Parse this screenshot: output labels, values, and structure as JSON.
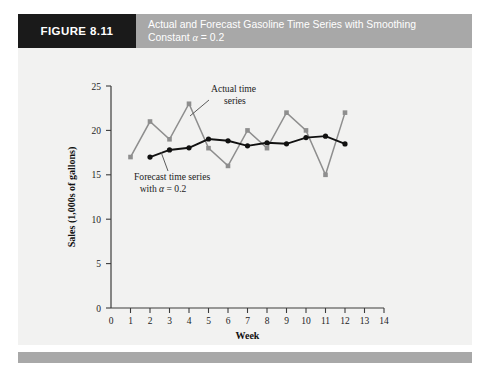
{
  "header": {
    "figure_tag": "FIGURE 8.11",
    "title_line1": "Actual and Forecast Gasoline Time Series with Smoothing",
    "title_line2_pre": "Constant ",
    "title_line2_alpha": "α",
    "title_line2_post": " = 0.2",
    "tag_bg": "#1a1a1a",
    "bar_bg": "#a8a8a8",
    "title_color": "#ffffff"
  },
  "annotations": {
    "actual_label_line1": "Actual time",
    "actual_label_line2": "series",
    "forecast_label_line1": "Forecast time series",
    "forecast_label_line2_pre": "with ",
    "forecast_label_line2_alpha": "α",
    "forecast_label_line2_post": " = 0.2"
  },
  "colors": {
    "actual": "#8e8e8e",
    "forecast": "#111111",
    "panel": "#f2f2f1",
    "axis": "#3c3c3c"
  },
  "chart_data": {
    "type": "line",
    "title": "Actual and Forecast Gasoline Time Series with Smoothing Constant α = 0.2",
    "xlabel": "Week",
    "ylabel": "Sales (1,000s of gallons)",
    "xlim": [
      0,
      14
    ],
    "ylim": [
      0,
      25
    ],
    "xticks": [
      0,
      1,
      2,
      3,
      4,
      5,
      6,
      7,
      8,
      9,
      10,
      11,
      12,
      13,
      14
    ],
    "yticks": [
      0,
      5,
      10,
      15,
      20,
      25
    ],
    "grid": false,
    "legend": "annotations-inline",
    "x": [
      1,
      2,
      3,
      4,
      5,
      6,
      7,
      8,
      9,
      10,
      11,
      12
    ],
    "series": [
      {
        "name": "Actual time series",
        "color": "#8e8e8e",
        "marker": "square",
        "x": [
          1,
          2,
          3,
          4,
          5,
          6,
          7,
          8,
          9,
          10,
          11,
          12
        ],
        "values": [
          17,
          21,
          19,
          23,
          18,
          16,
          20,
          18,
          22,
          20,
          15,
          22
        ]
      },
      {
        "name": "Forecast time series with α = 0.2",
        "color": "#111111",
        "marker": "circle",
        "x": [
          2,
          3,
          4,
          5,
          6,
          7,
          8,
          9,
          10,
          11,
          12
        ],
        "values": [
          17.0,
          17.8,
          18.04,
          19.03,
          18.83,
          18.26,
          18.61,
          18.49,
          19.19,
          19.35,
          18.48
        ]
      }
    ]
  }
}
